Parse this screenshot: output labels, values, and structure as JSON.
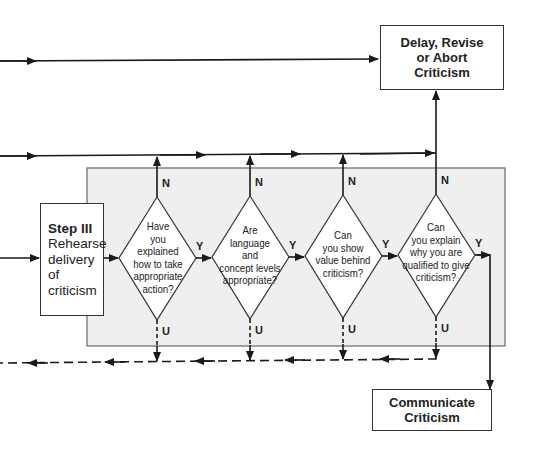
{
  "diagram": {
    "type": "flowchart",
    "colors": {
      "line": "#1a1a1a",
      "panel_fill": "#efefef",
      "panel_border": "#666666",
      "box_fill": "#ffffff"
    },
    "step_box": {
      "title": "Step III",
      "lines": [
        "Rehearse",
        "delivery",
        "of",
        "criticism"
      ]
    },
    "delay_box": {
      "lines": [
        "Delay, Revise",
        "or Abort",
        "Criticism"
      ]
    },
    "communicate_box": {
      "lines": [
        "Communicate",
        "Criticism"
      ]
    },
    "decisions": [
      {
        "lines": [
          "Have",
          "you",
          "explained",
          "how to take",
          "appropriate",
          "action?"
        ],
        "no_label": "N",
        "yes_label": "Y",
        "unsure_label": "U"
      },
      {
        "lines": [
          "Are",
          "language",
          "and",
          "concept levels",
          "appropriate?"
        ],
        "no_label": "N",
        "yes_label": "Y",
        "unsure_label": "U"
      },
      {
        "lines": [
          "Can",
          "you show",
          "value behind",
          "criticism?"
        ],
        "no_label": "N",
        "yes_label": "Y",
        "unsure_label": "U"
      },
      {
        "lines": [
          "Can",
          "you explain",
          "why you are",
          "qualified to give",
          "criticism?"
        ],
        "no_label": "N",
        "yes_label": "Y",
        "unsure_label": "U"
      }
    ]
  }
}
